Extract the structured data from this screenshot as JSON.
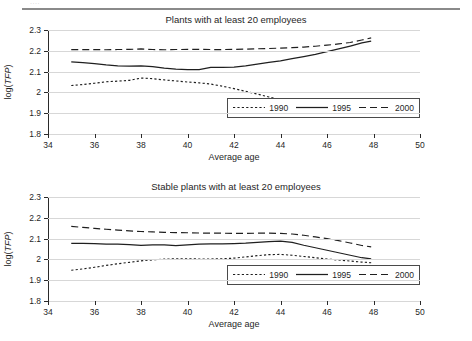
{
  "header": {
    "cut_off_fragment": "····"
  },
  "panels": [
    {
      "id": "panel-top",
      "title": "Plants with at least 20 employees"
    },
    {
      "id": "panel-bottom",
      "title": "Stable plants with at least 20 employees"
    }
  ],
  "axis": {
    "ylabel_prefix": "log(",
    "ylabel_italic": "TFP",
    "ylabel_suffix": ")",
    "xlabel": "Average age",
    "yticks": [
      "2.3",
      "2.2",
      "2.1",
      "2",
      "1.9",
      "1.8"
    ],
    "xticks": [
      "34",
      "36",
      "38",
      "40",
      "42",
      "44",
      "46",
      "48",
      "50"
    ]
  },
  "legend": {
    "items": [
      {
        "label": "1990",
        "style": "dotted",
        "color": "#1f1f1f"
      },
      {
        "label": "1995",
        "style": "solid",
        "color": "#1f1f1f"
      },
      {
        "label": "2000",
        "style": "dashed",
        "color": "#1f1f1f"
      }
    ]
  },
  "chart_data": [
    {
      "type": "line",
      "title": "Plants with at least 20 employees",
      "xlabel": "Average age",
      "ylabel": "log(TFP)",
      "xlim": [
        34,
        50
      ],
      "ylim": [
        1.8,
        2.3
      ],
      "xticks": [
        34,
        36,
        38,
        40,
        42,
        44,
        46,
        48,
        50
      ],
      "yticks": [
        1.8,
        1.9,
        2.0,
        2.1,
        2.2,
        2.3
      ],
      "grid": "horizontal",
      "legend_position": "bottom-right",
      "series": [
        {
          "name": "1990",
          "style": "dotted",
          "x": [
            35,
            35.5,
            36,
            36.5,
            37,
            37.5,
            38,
            38.5,
            39,
            39.5,
            40,
            40.5,
            41,
            41.5,
            42,
            42.5,
            43,
            43.5,
            44,
            44.5,
            45,
            45.5,
            46,
            46.5,
            47,
            47.5
          ],
          "y": [
            2.033,
            2.038,
            2.044,
            2.051,
            2.054,
            2.058,
            2.069,
            2.066,
            2.06,
            2.055,
            2.05,
            2.046,
            2.04,
            2.03,
            2.018,
            2.005,
            1.992,
            1.978,
            1.964,
            1.952,
            1.944,
            1.942,
            1.943,
            1.944,
            1.944,
            1.939
          ]
        },
        {
          "name": "1995",
          "style": "solid",
          "x": [
            35,
            35.5,
            36,
            36.5,
            37,
            37.5,
            38,
            38.5,
            39,
            39.5,
            40,
            40.5,
            41,
            41.5,
            42,
            42.5,
            43,
            43.5,
            44,
            44.5,
            45,
            45.5,
            46,
            46.5,
            47,
            47.5,
            47.9
          ],
          "y": [
            2.147,
            2.143,
            2.138,
            2.132,
            2.128,
            2.126,
            2.127,
            2.124,
            2.117,
            2.112,
            2.11,
            2.109,
            2.12,
            2.12,
            2.122,
            2.128,
            2.136,
            2.144,
            2.152,
            2.162,
            2.172,
            2.183,
            2.196,
            2.209,
            2.223,
            2.238,
            2.247
          ]
        },
        {
          "name": "2000",
          "style": "dashed",
          "x": [
            35,
            35.5,
            36,
            36.5,
            37,
            37.5,
            38,
            38.5,
            39,
            39.5,
            40,
            40.5,
            41,
            41.5,
            42,
            42.5,
            43,
            43.5,
            44,
            44.5,
            45,
            45.5,
            46,
            46.5,
            47,
            47.5,
            47.9
          ],
          "y": [
            2.206,
            2.206,
            2.206,
            2.205,
            2.206,
            2.207,
            2.209,
            2.206,
            2.205,
            2.206,
            2.207,
            2.207,
            2.206,
            2.206,
            2.207,
            2.208,
            2.21,
            2.211,
            2.213,
            2.215,
            2.218,
            2.222,
            2.227,
            2.233,
            2.24,
            2.252,
            2.262
          ]
        }
      ]
    },
    {
      "type": "line",
      "title": "Stable plants with at least 20 employees",
      "xlabel": "Average age",
      "ylabel": "log(TFP)",
      "xlim": [
        34,
        50
      ],
      "ylim": [
        1.8,
        2.3
      ],
      "xticks": [
        34,
        36,
        38,
        40,
        42,
        44,
        46,
        48,
        50
      ],
      "yticks": [
        1.8,
        1.9,
        2.0,
        2.1,
        2.2,
        2.3
      ],
      "grid": "horizontal",
      "legend_position": "bottom-right",
      "series": [
        {
          "name": "1990",
          "style": "dotted",
          "x": [
            35,
            35.5,
            36,
            36.5,
            37,
            37.5,
            38,
            38.5,
            39,
            39.5,
            40,
            40.5,
            41,
            41.5,
            42,
            42.5,
            43,
            43.5,
            44,
            44.5,
            45,
            45.5,
            46,
            46.5,
            47,
            47.5,
            47.9
          ],
          "y": [
            1.948,
            1.954,
            1.962,
            1.971,
            1.979,
            1.986,
            1.993,
            1.998,
            2.001,
            2.003,
            2.003,
            2.002,
            2.002,
            2.003,
            2.006,
            2.012,
            2.018,
            2.023,
            2.024,
            2.02,
            2.014,
            2.008,
            2.002,
            1.997,
            1.992,
            1.987,
            1.984
          ]
        },
        {
          "name": "1995",
          "style": "solid",
          "x": [
            35,
            35.5,
            36,
            36.5,
            37,
            37.5,
            38,
            38.5,
            39,
            39.5,
            40,
            40.5,
            41,
            41.5,
            42,
            42.5,
            43,
            43.5,
            44,
            44.5,
            45,
            45.5,
            46,
            46.5,
            47,
            47.5,
            47.9
          ],
          "y": [
            2.077,
            2.077,
            2.076,
            2.074,
            2.073,
            2.071,
            2.068,
            2.07,
            2.07,
            2.066,
            2.07,
            2.073,
            2.075,
            2.075,
            2.076,
            2.078,
            2.082,
            2.086,
            2.088,
            2.082,
            2.068,
            2.056,
            2.044,
            2.032,
            2.02,
            2.008,
            2.003
          ]
        },
        {
          "name": "2000",
          "style": "dashed",
          "x": [
            35,
            35.5,
            36,
            36.5,
            37,
            37.5,
            38,
            38.5,
            39,
            39.5,
            40,
            40.5,
            41,
            41.5,
            42,
            42.5,
            43,
            43.5,
            44,
            44.5,
            45,
            45.5,
            46,
            46.5,
            47,
            47.5,
            47.9
          ],
          "y": [
            2.159,
            2.154,
            2.149,
            2.145,
            2.141,
            2.137,
            2.134,
            2.132,
            2.13,
            2.129,
            2.128,
            2.127,
            2.126,
            2.126,
            2.125,
            2.125,
            2.126,
            2.126,
            2.125,
            2.122,
            2.116,
            2.108,
            2.1,
            2.09,
            2.079,
            2.067,
            2.06
          ]
        }
      ]
    }
  ]
}
